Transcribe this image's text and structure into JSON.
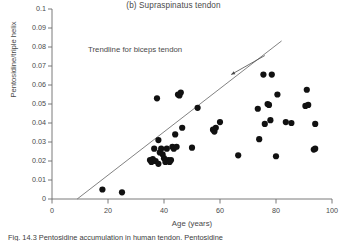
{
  "chart_data": {
    "type": "scatter",
    "title": "(b)  Supraspinatus tendon",
    "xlabel": "Age (years)",
    "ylabel": "Pentosidine/triple helix",
    "xlim": [
      0,
      100
    ],
    "ylim": [
      0,
      0.1
    ],
    "xticks": [
      0,
      20,
      40,
      60,
      80,
      100
    ],
    "yticks": [
      0,
      0.01,
      0.02,
      0.03,
      0.04,
      0.05,
      0.06,
      0.07,
      0.08,
      0.09,
      0.1
    ],
    "ytick_labels": [
      "0",
      "0.01",
      "0.02",
      "0.03",
      "0.04",
      "0.05",
      "0.06",
      "0.07",
      "0.08",
      "0.09",
      "0.1"
    ],
    "xtick_labels": [
      "0",
      "20",
      "40",
      "60",
      "80",
      "100"
    ],
    "grid": false,
    "legend": null,
    "marker": {
      "shape": "circle",
      "color": "#111111",
      "size_px": 3.1
    },
    "points": [
      {
        "x": 18,
        "y": 0.005
      },
      {
        "x": 25,
        "y": 0.0035
      },
      {
        "x": 35,
        "y": 0.0205
      },
      {
        "x": 35.5,
        "y": 0.0195
      },
      {
        "x": 36,
        "y": 0.021
      },
      {
        "x": 36.5,
        "y": 0.0265
      },
      {
        "x": 37,
        "y": 0.02
      },
      {
        "x": 37.5,
        "y": 0.053
      },
      {
        "x": 38,
        "y": 0.0185
      },
      {
        "x": 38,
        "y": 0.031
      },
      {
        "x": 38.5,
        "y": 0.0245
      },
      {
        "x": 39,
        "y": 0.0265
      },
      {
        "x": 39.5,
        "y": 0.0235
      },
      {
        "x": 40,
        "y": 0.0215
      },
      {
        "x": 40.5,
        "y": 0.0195
      },
      {
        "x": 41,
        "y": 0.0265
      },
      {
        "x": 41.5,
        "y": 0.0205
      },
      {
        "x": 42,
        "y": 0.0195
      },
      {
        "x": 42.5,
        "y": 0.0205
      },
      {
        "x": 43,
        "y": 0.0275
      },
      {
        "x": 43.5,
        "y": 0.0265
      },
      {
        "x": 44,
        "y": 0.034
      },
      {
        "x": 44.5,
        "y": 0.0275
      },
      {
        "x": 45,
        "y": 0.055
      },
      {
        "x": 45.5,
        "y": 0.0545
      },
      {
        "x": 46,
        "y": 0.056
      },
      {
        "x": 46.5,
        "y": 0.0375
      },
      {
        "x": 50,
        "y": 0.027
      },
      {
        "x": 52,
        "y": 0.048
      },
      {
        "x": 57.5,
        "y": 0.0365
      },
      {
        "x": 58,
        "y": 0.0355
      },
      {
        "x": 58.5,
        "y": 0.0375
      },
      {
        "x": 60,
        "y": 0.0405
      },
      {
        "x": 66.5,
        "y": 0.023
      },
      {
        "x": 73.5,
        "y": 0.0475
      },
      {
        "x": 74,
        "y": 0.0315
      },
      {
        "x": 75.5,
        "y": 0.0655
      },
      {
        "x": 76,
        "y": 0.0395
      },
      {
        "x": 77,
        "y": 0.05
      },
      {
        "x": 77.5,
        "y": 0.0495
      },
      {
        "x": 78,
        "y": 0.0415
      },
      {
        "x": 78.5,
        "y": 0.0655
      },
      {
        "x": 80,
        "y": 0.0225
      },
      {
        "x": 80.5,
        "y": 0.055
      },
      {
        "x": 83.5,
        "y": 0.0405
      },
      {
        "x": 85.5,
        "y": 0.04
      },
      {
        "x": 90.5,
        "y": 0.049
      },
      {
        "x": 91,
        "y": 0.0575
      },
      {
        "x": 91.5,
        "y": 0.0495
      },
      {
        "x": 93.5,
        "y": 0.026
      },
      {
        "x": 94,
        "y": 0.0265
      },
      {
        "x": 94,
        "y": 0.0395
      }
    ],
    "trendline": {
      "label": "Trendline for biceps tendon",
      "x_start": 9,
      "y_start": 0,
      "x_end": 82,
      "y_end": 0.0832,
      "color": "#6b6b6b"
    },
    "annotation": {
      "text": "Trendline for biceps tendon",
      "arrow_from": {
        "x": 76,
        "y": 0.0755
      },
      "arrow_to": {
        "x": 64,
        "y": 0.0655
      }
    }
  },
  "caption": {
    "text": "Fig. 14.3  Pentosidine accumulation in human tendon. Pentosidine"
  }
}
